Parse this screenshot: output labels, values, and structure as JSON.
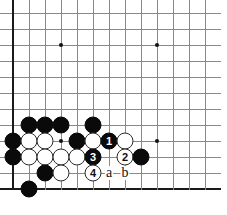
{
  "diagram": {
    "kind": "go-board-diagram",
    "board_region": "lower-left corner",
    "geometry": {
      "origin_x": 13,
      "origin_y": 13,
      "cell": 16,
      "cols": 13,
      "rows": 12,
      "stone_diameter": 17
    },
    "edges": {
      "left_edge_col": 0,
      "bottom_edge_row": 11
    },
    "star_points": [
      {
        "col": 3,
        "row": 2
      },
      {
        "col": 9,
        "row": 2
      },
      {
        "col": 3,
        "row": 8
      },
      {
        "col": 9,
        "row": 8
      }
    ],
    "stones": [
      {
        "color": "black",
        "col": 1,
        "row": 7,
        "label": ""
      },
      {
        "color": "black",
        "col": 2,
        "row": 7,
        "label": ""
      },
      {
        "color": "black",
        "col": 3,
        "row": 7,
        "label": ""
      },
      {
        "color": "black",
        "col": 5,
        "row": 7,
        "label": ""
      },
      {
        "color": "black",
        "col": 0,
        "row": 8,
        "label": ""
      },
      {
        "color": "white",
        "col": 1,
        "row": 8,
        "label": ""
      },
      {
        "color": "white",
        "col": 2,
        "row": 8,
        "label": ""
      },
      {
        "color": "black",
        "col": 4,
        "row": 8,
        "label": ""
      },
      {
        "color": "white",
        "col": 5,
        "row": 8,
        "label": ""
      },
      {
        "color": "black",
        "col": 6,
        "row": 8,
        "label": "1"
      },
      {
        "color": "white",
        "col": 7,
        "row": 8,
        "label": ""
      },
      {
        "color": "black",
        "col": 0,
        "row": 9,
        "label": ""
      },
      {
        "color": "white",
        "col": 1,
        "row": 9,
        "label": ""
      },
      {
        "color": "white",
        "col": 2,
        "row": 9,
        "label": ""
      },
      {
        "color": "white",
        "col": 3,
        "row": 9,
        "label": ""
      },
      {
        "color": "white",
        "col": 4,
        "row": 9,
        "label": ""
      },
      {
        "color": "black",
        "col": 5,
        "row": 9,
        "label": "3"
      },
      {
        "color": "white",
        "col": 7,
        "row": 9,
        "label": "2"
      },
      {
        "color": "black",
        "col": 8,
        "row": 9,
        "label": ""
      },
      {
        "color": "black",
        "col": 2,
        "row": 10,
        "label": ""
      },
      {
        "color": "white",
        "col": 3,
        "row": 10,
        "label": ""
      },
      {
        "color": "white",
        "col": 5,
        "row": 10,
        "label": "4"
      },
      {
        "color": "black",
        "col": 1,
        "row": 11,
        "label": ""
      }
    ],
    "letter_markers": [
      {
        "text": "a",
        "col": 6,
        "row": 10
      },
      {
        "text": "b",
        "col": 7,
        "row": 10
      }
    ],
    "colors": {
      "grid": "#8a8a8a",
      "edge": "#1a1a1a",
      "black_stone": "#0a0a0a",
      "white_stone": "#ffffff",
      "white_stone_border": "#2b2b2b",
      "background": "#ffffff",
      "text": "#111111"
    }
  }
}
